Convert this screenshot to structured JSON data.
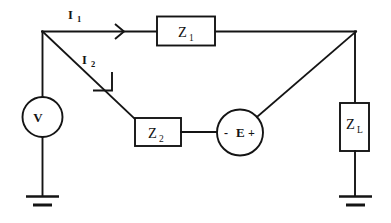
{
  "diagram": {
    "type": "electrical-schematic",
    "background_color": "#ffffff",
    "line_color": "#141414"
  },
  "components": {
    "source_v": {
      "label": "V",
      "kind": "voltage-source",
      "shape": "circle"
    },
    "source_e": {
      "label": "E",
      "minus_sign": "-",
      "plus_sign": "+",
      "kind": "voltage-source",
      "shape": "circle"
    },
    "impedance_z1": {
      "label": "Z",
      "subscript": "1",
      "kind": "impedance",
      "shape": "rectangle"
    },
    "impedance_z2": {
      "label": "Z",
      "subscript": "2",
      "kind": "impedance",
      "shape": "rectangle"
    },
    "impedance_zl": {
      "label": "Z",
      "subscript": "L",
      "kind": "load-impedance",
      "shape": "rectangle"
    }
  },
  "currents": {
    "i1": {
      "label": "I",
      "subscript": "1",
      "direction": "right"
    },
    "i2": {
      "label": "I",
      "subscript": "2",
      "direction": "down-right"
    }
  },
  "grounds": {
    "ground_left": {
      "name": "earth-ground"
    },
    "ground_right": {
      "name": "earth-ground"
    }
  }
}
